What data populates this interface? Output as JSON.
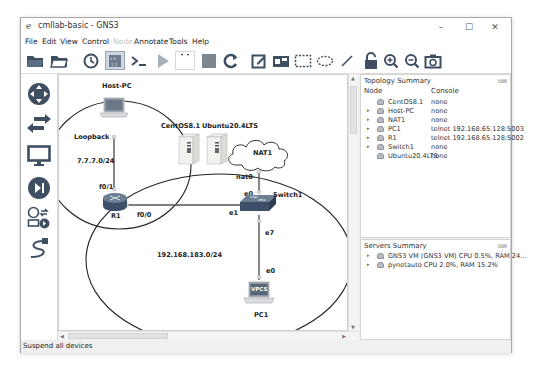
{
  "window": {
    "title": "cmllab-basic - GNS3",
    "controls": {
      "minimize": "–",
      "maximize": "☐",
      "close": "✕"
    }
  },
  "menubar": {
    "items": [
      {
        "label": "File",
        "enabled": true
      },
      {
        "label": "Edit",
        "enabled": true
      },
      {
        "label": "View",
        "enabled": true
      },
      {
        "label": "Control",
        "enabled": true
      },
      {
        "label": "Node",
        "enabled": false
      },
      {
        "label": "Annotate",
        "enabled": true
      },
      {
        "label": "Tools",
        "enabled": true
      },
      {
        "label": "Help",
        "enabled": true
      }
    ]
  },
  "toolbar": {
    "buttons": [
      "open-project",
      "open-recent",
      "snapshot",
      "show-interface-labels",
      "console-all",
      "start-all",
      "suspend-all",
      "stop-all",
      "reload-all",
      "add-note",
      "insert-picture",
      "draw-rectangle",
      "draw-ellipse",
      "draw-line",
      "lock",
      "zoom-in",
      "zoom-out",
      "screenshot"
    ],
    "active": "show-interface-labels"
  },
  "device_bar": {
    "items": [
      "routers",
      "switches",
      "end-devices",
      "security-devices",
      "all-devices",
      "add-link"
    ]
  },
  "canvas": {
    "nodes": [
      {
        "name": "Host-PC",
        "type": "computer"
      },
      {
        "name": "CentOS8.1",
        "type": "server"
      },
      {
        "name": "Ubuntu20.4LTS",
        "type": "server"
      },
      {
        "name": "NAT1",
        "type": "cloud"
      },
      {
        "name": "R1",
        "type": "router"
      },
      {
        "name": "Switch1",
        "type": "switch"
      },
      {
        "name": "PC1",
        "type": "vpcs",
        "badge": "VPCS"
      }
    ],
    "ports": {
      "loopback": "Loopback",
      "r1_f01": "f0/1",
      "r1_f00": "f0/0",
      "nat0": "nat0",
      "sw_e0": "e0",
      "sw_e1": "e1",
      "sw_e7": "e7",
      "pc_e0": "e0"
    },
    "notes": {
      "loop_net": "7.7.7.0/24",
      "lan_net": "192.168.183.0/24"
    }
  },
  "topology_summary": {
    "title": "Topology Summary",
    "columns": [
      "Node",
      "Console"
    ],
    "rows": [
      {
        "expandable": false,
        "node": "CentOS8.1",
        "console": "none"
      },
      {
        "expandable": true,
        "node": "Host-PC",
        "console": "none"
      },
      {
        "expandable": true,
        "node": "NAT1",
        "console": "none"
      },
      {
        "expandable": true,
        "node": "PC1",
        "console": "telnet 192.168.65.128:5003"
      },
      {
        "expandable": true,
        "node": "R1",
        "console": "telnet 192.168.65.128:5002"
      },
      {
        "expandable": true,
        "node": "Switch1",
        "console": "none"
      },
      {
        "expandable": false,
        "node": "Ubuntu20.4LTS",
        "console": "none"
      }
    ]
  },
  "servers_summary": {
    "title": "Servers Summary",
    "rows": [
      {
        "text": "GNS3 VM (GNS3 VM) CPU 0.5%, RAM 24..."
      },
      {
        "text": "pynetauto CPU 2.0%, RAM 15.2%"
      }
    ]
  },
  "statusbar": {
    "message": "Suspend all devices"
  },
  "colors": {
    "accent": "#3a4a5c",
    "link": "#222222",
    "router": "#3c4f66"
  }
}
